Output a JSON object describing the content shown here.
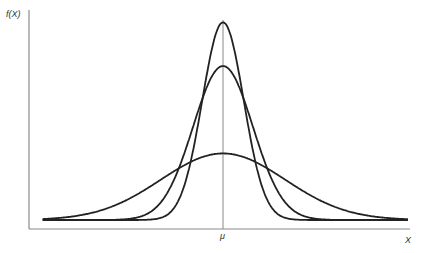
{
  "chart_data": {
    "type": "line",
    "title": "",
    "ylabel": "f(X)",
    "xlabel": "X",
    "x_ticks": [
      {
        "value": 0,
        "label": "μ"
      }
    ],
    "xlim": [
      -4,
      4
    ],
    "ylim": [
      0,
      1.0
    ],
    "grid": false,
    "legend": "none",
    "series": [
      {
        "name": "tall-narrow",
        "mu": 0,
        "sigma": 0.45,
        "peak": 0.95
      },
      {
        "name": "medium",
        "mu": 0,
        "sigma": 0.65,
        "peak": 0.74
      },
      {
        "name": "flat-wide",
        "mu": 0,
        "sigma": 1.35,
        "peak": 0.32
      }
    ]
  }
}
